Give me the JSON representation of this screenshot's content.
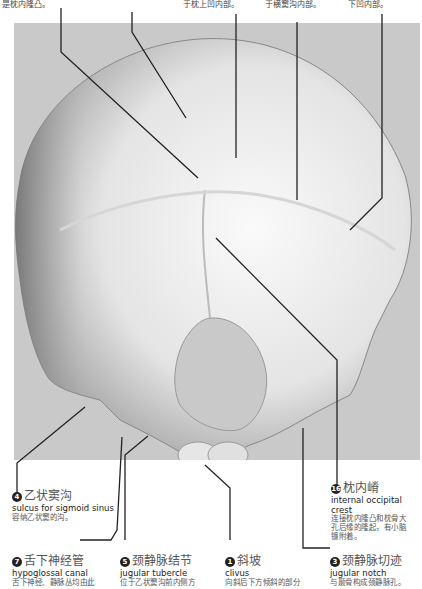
{
  "top_fragments": [
    {
      "id": "frag-1",
      "text": "是枕内隆凸。",
      "x": 2
    },
    {
      "id": "frag-2",
      "text": "于枕上凹内部。",
      "x": 183
    },
    {
      "id": "frag-3",
      "text": "于横窦沟内部。",
      "x": 265
    },
    {
      "id": "frag-4",
      "text": "下凹内部。",
      "x": 348
    }
  ],
  "labels": [
    {
      "number": "4",
      "zh": "乙状窦沟",
      "en": "sulcus for sigmoid sinus",
      "desc": [
        "容纳乙状窦的沟。"
      ]
    },
    {
      "number": "16",
      "zh": "枕内嵴",
      "en": "internal occipital crest",
      "desc": [
        "连接枕内隆凸和枕骨大",
        "孔后缘的隆起，有小脑",
        "镰附着。"
      ]
    },
    {
      "number": "7",
      "zh": "舌下神经管",
      "en": "hypoglossal  canal",
      "desc": [
        "舌下神经、静脉丛均由此"
      ]
    },
    {
      "number": "5",
      "zh": "颈静脉结节",
      "en": "jugular tubercle",
      "desc": [
        "位于乙状窦沟前内侧方"
      ]
    },
    {
      "number": "1",
      "zh": "斜坡",
      "en": "clivus",
      "desc": [
        "向斜后下方倾斜的部分"
      ]
    },
    {
      "number": "3",
      "zh": "颈静脉切迹",
      "en": "jugular notch",
      "desc": [
        "与颞骨构成颈静脉孔。"
      ]
    }
  ],
  "colors": {
    "background": "#ffffff",
    "figure_bg": "#c9c9c9",
    "bone_light": "#f2f2f2",
    "bone_dark": "#8a8a8a",
    "leader_line": "#222222"
  }
}
